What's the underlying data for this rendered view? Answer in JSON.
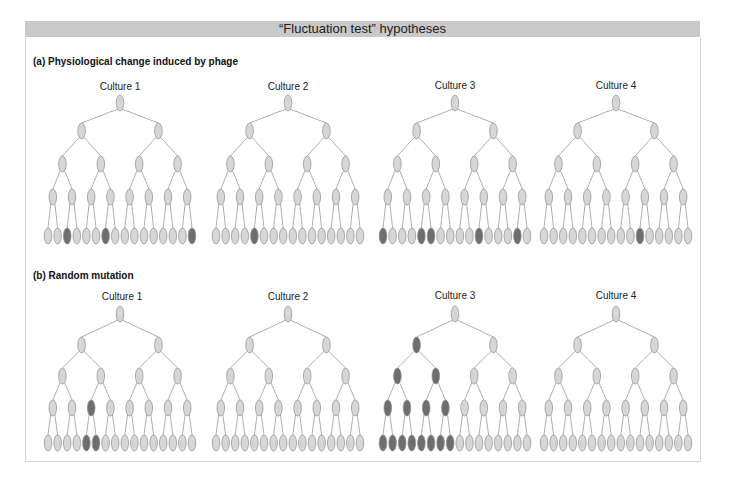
{
  "title": "“Fluctuation test” hypotheses",
  "colors": {
    "header_bar": "#c9c9c9",
    "node_light": "#d6d6d6",
    "node_dark": "#6e6e6e",
    "node_stroke": "#8f8f8f",
    "edge": "#9a9a9a"
  },
  "sections": [
    {
      "label": "(a)  Physiological change induced by phage",
      "cultures": [
        {
          "label": "Culture 1",
          "dark_nodes": {
            "leaves": [
              2,
              6,
              15
            ]
          }
        },
        {
          "label": "Culture 2",
          "dark_nodes": {
            "leaves": [
              4
            ]
          }
        },
        {
          "label": "Culture 3",
          "dark_nodes": {
            "leaves": [
              0,
              4,
              5,
              10,
              14
            ]
          }
        },
        {
          "label": "Culture 4",
          "dark_nodes": {
            "leaves": [
              10
            ]
          }
        }
      ]
    },
    {
      "label": "(b)  Random mutation",
      "cultures": [
        {
          "label": "Culture 1",
          "dark_nodes": {
            "level3": [
              2
            ],
            "leaves": [
              4,
              5
            ]
          }
        },
        {
          "label": "Culture 2",
          "dark_nodes": {}
        },
        {
          "label": "Culture 3",
          "dark_nodes": {
            "level1": [
              0
            ],
            "level2": [
              0,
              1
            ],
            "level3": [
              0,
              1,
              2,
              3
            ],
            "leaves": [
              0,
              1,
              2,
              3,
              4,
              5,
              6,
              7
            ]
          }
        },
        {
          "label": "Culture 4",
          "dark_nodes": {}
        }
      ]
    }
  ]
}
